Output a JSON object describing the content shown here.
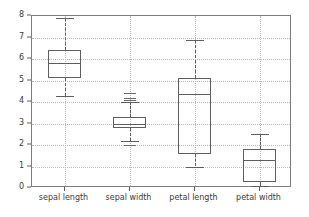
{
  "chart_data": {
    "type": "box",
    "title": "",
    "xlabel": "",
    "ylabel": "",
    "ylim": [
      0,
      8
    ],
    "yticks": [
      0,
      1,
      2,
      3,
      4,
      5,
      6,
      7,
      8
    ],
    "ytick_labels": [
      "0",
      "1",
      "2",
      "3",
      "4",
      "5",
      "6",
      "7",
      "8"
    ],
    "grid": true,
    "grid_style": "dotted",
    "legend": false,
    "categories": [
      "sepal length",
      "sepal width",
      "petal length",
      "petal width"
    ],
    "boxes": [
      {
        "label": "sepal length",
        "whisker_low": 4.3,
        "q1": 5.1,
        "median": 5.8,
        "q3": 6.4,
        "whisker_high": 7.9,
        "fliers": []
      },
      {
        "label": "sepal width",
        "whisker_low": 2.2,
        "q1": 2.8,
        "median": 3.0,
        "q3": 3.3,
        "whisker_high": 4.0,
        "fliers": [
          4.4,
          4.2,
          4.1,
          2.0
        ]
      },
      {
        "label": "petal length",
        "whisker_low": 1.0,
        "q1": 1.6,
        "median": 4.35,
        "q3": 5.1,
        "whisker_high": 6.9,
        "fliers": []
      },
      {
        "label": "petal width",
        "whisker_low": 0.1,
        "q1": 0.3,
        "median": 1.3,
        "q3": 1.8,
        "whisker_high": 2.5,
        "fliers": []
      }
    ],
    "colors": {
      "box_edge": "#5e5e5e",
      "median": "#5e5e5e",
      "whisker": "#5e5e5e",
      "grid": "#b9b9b9",
      "axis": "#7d7d7d",
      "background": "#ffffff",
      "tick_text": "#3a3a3a"
    }
  }
}
